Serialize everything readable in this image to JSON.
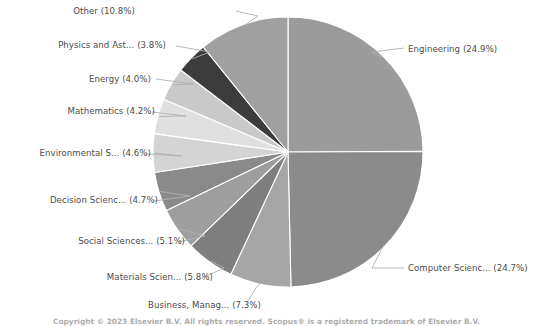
{
  "chart_data": {
    "type": "pie",
    "title": "",
    "legend_position": "outside-labels",
    "total_percent": 99.9,
    "center": {
      "x": 288,
      "y": 152
    },
    "radius": 135,
    "start_angle_deg": 0,
    "direction": "clockwise",
    "categories": [
      "Engineering",
      "Computer Scienc...",
      "Business, Manag...",
      "Materials Scien...",
      "Social Sciences...",
      "Decision Scienc...",
      "Environmental S...",
      "Mathematics",
      "Energy",
      "Physics and Ast...",
      "Other"
    ],
    "values": [
      24.9,
      24.7,
      7.3,
      5.8,
      5.1,
      4.7,
      4.6,
      4.2,
      4.0,
      3.8,
      10.8
    ],
    "colors": [
      "#9b9b9b",
      "#8b8b8b",
      "#a6a6a6",
      "#7e7e7e",
      "#9e9e9e",
      "#8a8a8a",
      "#d4d4d4",
      "#e0e0e0",
      "#c9c9c9",
      "#3c3c3c",
      "#a0a0a0"
    ],
    "slices": [
      {
        "label": "Engineering (24.9%)",
        "name": "Engineering",
        "percent": 24.9,
        "color": "#9b9b9b",
        "side": "right"
      },
      {
        "label": "Computer Scienc... (24.7%)",
        "name": "Computer Scienc...",
        "percent": 24.7,
        "color": "#8b8b8b",
        "side": "right"
      },
      {
        "label": "Business, Manag... (7.3%)",
        "name": "Business, Manag...",
        "percent": 7.3,
        "color": "#a6a6a6",
        "side": "left"
      },
      {
        "label": "Materials Scien... (5.8%)",
        "name": "Materials Scien...",
        "percent": 5.8,
        "color": "#7e7e7e",
        "side": "left"
      },
      {
        "label": "Social Sciences... (5.1%)",
        "name": "Social Sciences...",
        "percent": 5.1,
        "color": "#9e9e9e",
        "side": "left"
      },
      {
        "label": "Decision Scienc... (4.7%)",
        "name": "Decision Scienc...",
        "percent": 4.7,
        "color": "#8a8a8a",
        "side": "left"
      },
      {
        "label": "Environmental S... (4.6%)",
        "name": "Environmental S...",
        "percent": 4.6,
        "color": "#d4d4d4",
        "side": "left"
      },
      {
        "label": "Mathematics (4.2%)",
        "name": "Mathematics",
        "percent": 4.2,
        "color": "#e0e0e0",
        "side": "left"
      },
      {
        "label": "Energy (4.0%)",
        "name": "Energy",
        "percent": 4.0,
        "color": "#c9c9c9",
        "side": "left"
      },
      {
        "label": "Physics and Ast... (3.8%)",
        "name": "Physics and Ast...",
        "percent": 3.8,
        "color": "#3c3c3c",
        "side": "left"
      },
      {
        "label": "Other (10.8%)",
        "name": "Other",
        "percent": 10.8,
        "color": "#a0a0a0",
        "side": "left"
      }
    ]
  },
  "labels": {
    "engineering": "Engineering (24.9%)",
    "computer_science": "Computer Scienc... (24.7%)",
    "business": "Business, Manag... (7.3%)",
    "materials": "Materials Scien... (5.8%)",
    "social": "Social Sciences... (5.1%)",
    "decision": "Decision Scienc... (4.7%)",
    "environmental": "Environmental S... (4.6%)",
    "mathematics": "Mathematics (4.2%)",
    "energy": "Energy (4.0%)",
    "physics": "Physics and Ast... (3.8%)",
    "other": "Other (10.8%)"
  },
  "footer": {
    "copyright": "Copyright © 2023 Elsevier B.V. All rights reserved. Scopus® is a registered trademark of Elsevier B.V."
  }
}
